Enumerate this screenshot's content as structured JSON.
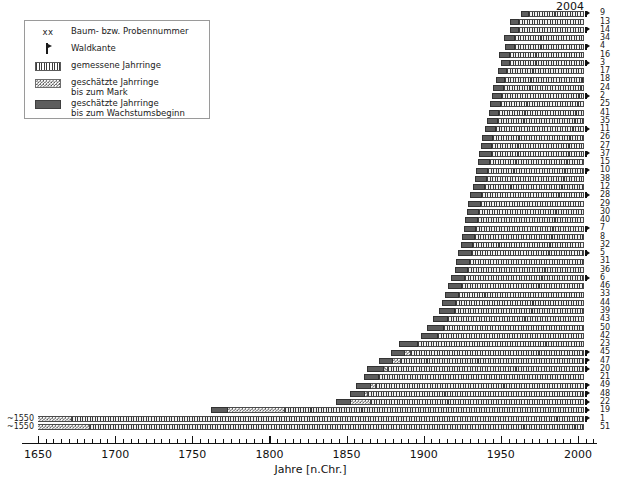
{
  "legend": {
    "title": "",
    "items": [
      {
        "key": "xx",
        "key_type": "text",
        "label": "Baum- bzw. Probennummer"
      },
      {
        "key": "waldkante-marker",
        "key_type": "waldkante",
        "label": "Waldkante"
      },
      {
        "key": "hatch-swatch",
        "key_type": "hatch",
        "label": "gemessene Jahrringe"
      },
      {
        "key": "dotted-swatch",
        "key_type": "dots",
        "label": "geschätzte Jahrringe\nbis zum Mark"
      },
      {
        "key": "solid-swatch",
        "key_type": "solid",
        "label": "geschätzte Jahrringe\nbis zum Wachstumsbeginn"
      }
    ]
  },
  "axis": {
    "title": "Jahre [n.Chr.]",
    "min": 1645,
    "max": 2012,
    "tick_labels": [
      "1650",
      "1700",
      "1750",
      "1800",
      "1850",
      "1900",
      "1950",
      "2000"
    ],
    "tick_values": [
      1650,
      1700,
      1750,
      1800,
      1850,
      1900,
      1950,
      2000
    ],
    "minor_step": 5
  },
  "annotations": {
    "top_year": "2004"
  },
  "colors": {
    "bar_estimate_growth": "#5d5d5d",
    "bar_measured": "#3a3a3a",
    "bar_pith": "#555555",
    "axis": "#111111",
    "background": "#ffffff",
    "legend_border": "#9a9a9a"
  },
  "chart_data": {
    "type": "bar",
    "title": "",
    "subtitle": "",
    "xlabel": "Jahre [n.Chr.]",
    "ylabel": "",
    "xlim": [
      1645,
      2012
    ],
    "grid": false,
    "legend_position": "top-left",
    "orientation": "horizontal-range",
    "note": "Dendrochronological bar chart: each row is one tree/sample. Segments: estimated rings to growth start (solid dark), estimated rings to pith (dotted), measured rings (hatched). Waldkante marker flags a preserved bark edge.",
    "categories": [
      "9",
      "13",
      "14",
      "34",
      "4",
      "16",
      "3",
      "17",
      "18",
      "24",
      "2",
      "25",
      "41",
      "35",
      "11",
      "26",
      "27",
      "37",
      "15",
      "10",
      "38",
      "12",
      "28",
      "29",
      "30",
      "40",
      "7",
      "8",
      "32",
      "5",
      "31",
      "36",
      "6",
      "46",
      "33",
      "44",
      "39",
      "43",
      "50",
      "42",
      "23",
      "45",
      "47",
      "20",
      "21",
      "49",
      "48",
      "22",
      "19",
      "1",
      "51"
    ],
    "rows": [
      {
        "label": "9",
        "pith_label": "",
        "growth_start": 1963,
        "pith_start": 1968,
        "meas_start": 1968,
        "meas_end": 2004,
        "waldkante": true
      },
      {
        "label": "13",
        "pith_label": "",
        "growth_start": 1956,
        "pith_start": 1962,
        "meas_start": 1962,
        "meas_end": 2004,
        "waldkante": false
      },
      {
        "label": "14",
        "pith_label": "",
        "growth_start": 1956,
        "pith_start": 1962,
        "meas_start": 1962,
        "meas_end": 2004,
        "waldkante": true
      },
      {
        "label": "34",
        "pith_label": "",
        "growth_start": 1952,
        "pith_start": 1959,
        "meas_start": 1959,
        "meas_end": 2004,
        "waldkante": false
      },
      {
        "label": "4",
        "pith_label": "",
        "growth_start": 1953,
        "pith_start": 1959,
        "meas_start": 1959,
        "meas_end": 2004,
        "waldkante": true
      },
      {
        "label": "16",
        "pith_label": "",
        "growth_start": 1949,
        "pith_start": 1956,
        "meas_start": 1956,
        "meas_end": 2004,
        "waldkante": false
      },
      {
        "label": "3",
        "pith_label": "",
        "growth_start": 1950,
        "pith_start": 1956,
        "meas_start": 1956,
        "meas_end": 2004,
        "waldkante": true
      },
      {
        "label": "17",
        "pith_label": "",
        "growth_start": 1948,
        "pith_start": 1954,
        "meas_start": 1954,
        "meas_end": 2004,
        "waldkante": false
      },
      {
        "label": "18",
        "pith_label": "",
        "growth_start": 1947,
        "pith_start": 1953,
        "meas_start": 1953,
        "meas_end": 2004,
        "waldkante": false
      },
      {
        "label": "24",
        "pith_label": "",
        "growth_start": 1945,
        "pith_start": 1952,
        "meas_start": 1952,
        "meas_end": 2004,
        "waldkante": false
      },
      {
        "label": "2",
        "pith_label": "",
        "growth_start": 1944,
        "pith_start": 1951,
        "meas_start": 1951,
        "meas_end": 2004,
        "waldkante": true
      },
      {
        "label": "25",
        "pith_label": "",
        "growth_start": 1943,
        "pith_start": 1950,
        "meas_start": 1950,
        "meas_end": 2004,
        "waldkante": false
      },
      {
        "label": "41",
        "pith_label": "",
        "growth_start": 1942,
        "pith_start": 1949,
        "meas_start": 1949,
        "meas_end": 2004,
        "waldkante": false
      },
      {
        "label": "35",
        "pith_label": "",
        "growth_start": 1941,
        "pith_start": 1948,
        "meas_start": 1948,
        "meas_end": 2004,
        "waldkante": false
      },
      {
        "label": "11",
        "pith_label": "",
        "growth_start": 1940,
        "pith_start": 1947,
        "meas_start": 1947,
        "meas_end": 2004,
        "waldkante": true
      },
      {
        "label": "26",
        "pith_label": "",
        "growth_start": 1938,
        "pith_start": 1945,
        "meas_start": 1945,
        "meas_end": 2004,
        "waldkante": false
      },
      {
        "label": "27",
        "pith_label": "",
        "growth_start": 1937,
        "pith_start": 1944,
        "meas_start": 1944,
        "meas_end": 2004,
        "waldkante": false
      },
      {
        "label": "37",
        "pith_label": "",
        "growth_start": 1936,
        "pith_start": 1944,
        "meas_start": 1944,
        "meas_end": 2004,
        "waldkante": true
      },
      {
        "label": "15",
        "pith_label": "",
        "growth_start": 1935,
        "pith_start": 1943,
        "meas_start": 1943,
        "meas_end": 2004,
        "waldkante": false
      },
      {
        "label": "10",
        "pith_label": "",
        "growth_start": 1934,
        "pith_start": 1942,
        "meas_start": 1942,
        "meas_end": 2004,
        "waldkante": true
      },
      {
        "label": "38",
        "pith_label": "",
        "growth_start": 1933,
        "pith_start": 1941,
        "meas_start": 1941,
        "meas_end": 2004,
        "waldkante": false
      },
      {
        "label": "12",
        "pith_label": "",
        "growth_start": 1932,
        "pith_start": 1940,
        "meas_start": 1940,
        "meas_end": 2004,
        "waldkante": false
      },
      {
        "label": "28",
        "pith_label": "",
        "growth_start": 1930,
        "pith_start": 1938,
        "meas_start": 1938,
        "meas_end": 2004,
        "waldkante": true
      },
      {
        "label": "29",
        "pith_label": "",
        "growth_start": 1929,
        "pith_start": 1937,
        "meas_start": 1937,
        "meas_end": 2004,
        "waldkante": false
      },
      {
        "label": "30",
        "pith_label": "",
        "growth_start": 1928,
        "pith_start": 1936,
        "meas_start": 1936,
        "meas_end": 2004,
        "waldkante": false
      },
      {
        "label": "40",
        "pith_label": "",
        "growth_start": 1927,
        "pith_start": 1935,
        "meas_start": 1935,
        "meas_end": 2004,
        "waldkante": false
      },
      {
        "label": "7",
        "pith_label": "",
        "growth_start": 1926,
        "pith_start": 1934,
        "meas_start": 1934,
        "meas_end": 2004,
        "waldkante": true
      },
      {
        "label": "8",
        "pith_label": "",
        "growth_start": 1925,
        "pith_start": 1933,
        "meas_start": 1933,
        "meas_end": 2004,
        "waldkante": false
      },
      {
        "label": "32",
        "pith_label": "",
        "growth_start": 1924,
        "pith_start": 1932,
        "meas_start": 1932,
        "meas_end": 2004,
        "waldkante": false
      },
      {
        "label": "5",
        "pith_label": "",
        "growth_start": 1922,
        "pith_start": 1931,
        "meas_start": 1931,
        "meas_end": 2004,
        "waldkante": true
      },
      {
        "label": "31",
        "pith_label": "",
        "growth_start": 1921,
        "pith_start": 1930,
        "meas_start": 1930,
        "meas_end": 2004,
        "waldkante": false
      },
      {
        "label": "36",
        "pith_label": "",
        "growth_start": 1920,
        "pith_start": 1929,
        "meas_start": 1929,
        "meas_end": 2004,
        "waldkante": false
      },
      {
        "label": "6",
        "pith_label": "",
        "growth_start": 1918,
        "pith_start": 1927,
        "meas_start": 1927,
        "meas_end": 2004,
        "waldkante": true
      },
      {
        "label": "46",
        "pith_label": "",
        "growth_start": 1916,
        "pith_start": 1925,
        "meas_start": 1925,
        "meas_end": 2004,
        "waldkante": false
      },
      {
        "label": "33",
        "pith_label": "",
        "growth_start": 1914,
        "pith_start": 1923,
        "meas_start": 1923,
        "meas_end": 2004,
        "waldkante": false
      },
      {
        "label": "44",
        "pith_label": "",
        "growth_start": 1912,
        "pith_start": 1921,
        "meas_start": 1921,
        "meas_end": 2004,
        "waldkante": false
      },
      {
        "label": "39",
        "pith_label": "",
        "growth_start": 1910,
        "pith_start": 1920,
        "meas_start": 1920,
        "meas_end": 2004,
        "waldkante": false
      },
      {
        "label": "43",
        "pith_label": "",
        "growth_start": 1906,
        "pith_start": 1916,
        "meas_start": 1916,
        "meas_end": 2004,
        "waldkante": false
      },
      {
        "label": "50",
        "pith_label": "",
        "growth_start": 1902,
        "pith_start": 1913,
        "meas_start": 1913,
        "meas_end": 2004,
        "waldkante": false
      },
      {
        "label": "42",
        "pith_label": "",
        "growth_start": 1898,
        "pith_start": 1909,
        "meas_start": 1909,
        "meas_end": 2004,
        "waldkante": false
      },
      {
        "label": "23",
        "pith_label": "",
        "growth_start": 1884,
        "pith_start": 1896,
        "meas_start": 1896,
        "meas_end": 2004,
        "waldkante": false
      },
      {
        "label": "45",
        "pith_label": "",
        "growth_start": 1879,
        "pith_start": 1888,
        "meas_start": 1892,
        "meas_end": 2004,
        "waldkante": true
      },
      {
        "label": "47",
        "pith_label": "",
        "growth_start": 1871,
        "pith_start": 1880,
        "meas_start": 1885,
        "meas_end": 2004,
        "waldkante": true
      },
      {
        "label": "20",
        "pith_label": "",
        "growth_start": 1863,
        "pith_start": 1874,
        "meas_start": 1877,
        "meas_end": 2004,
        "waldkante": true
      },
      {
        "label": "21",
        "pith_label": "",
        "growth_start": 1861,
        "pith_start": 1871,
        "meas_start": 1871,
        "meas_end": 2004,
        "waldkante": false
      },
      {
        "label": "49",
        "pith_label": "",
        "growth_start": 1856,
        "pith_start": 1866,
        "meas_start": 1869,
        "meas_end": 2004,
        "waldkante": true
      },
      {
        "label": "48",
        "pith_label": "",
        "growth_start": 1852,
        "pith_start": 1862,
        "meas_start": 1864,
        "meas_end": 2004,
        "waldkante": true
      },
      {
        "label": "22",
        "pith_label": "",
        "growth_start": 1843,
        "pith_start": 1853,
        "meas_start": 1866,
        "meas_end": 2004,
        "waldkante": true
      },
      {
        "label": "19",
        "pith_label": "",
        "growth_start": 1762,
        "pith_start": 1773,
        "meas_start": 1810,
        "meas_end": 2004,
        "waldkante": true
      },
      {
        "label": "1",
        "pith_label": "~1550",
        "growth_start": 1650,
        "pith_start": 1650,
        "meas_start": 1672,
        "meas_end": 2004,
        "waldkante": true
      },
      {
        "label": "51",
        "pith_label": "~1550",
        "growth_start": 1650,
        "pith_start": 1650,
        "meas_start": 1684,
        "meas_end": 2004,
        "waldkante": false
      }
    ]
  }
}
